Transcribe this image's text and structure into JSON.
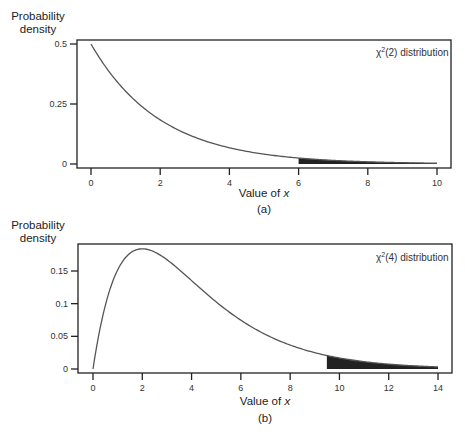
{
  "chart_data": [
    {
      "id": "a",
      "type": "line",
      "title": "χ²(2) distribution",
      "legend_text": "distribution",
      "legend_symbol": "χ",
      "legend_sup": "2",
      "legend_df": "(2)",
      "df": 2,
      "xlabel": "Value of x",
      "xlabel_prefix": "Value of ",
      "xlabel_var": "x",
      "ylabel_line1": "Probability",
      "ylabel_line2": "density",
      "caption": "(a)",
      "xlim": [
        0,
        10
      ],
      "ylim": [
        0,
        0.5
      ],
      "x_ticks": [
        0,
        2,
        4,
        6,
        8,
        10
      ],
      "x_tick_labels": [
        "0",
        "2",
        "4",
        "6",
        "8",
        "10"
      ],
      "y_ticks": [
        0,
        0.25,
        0.5
      ],
      "y_tick_labels": [
        "0",
        "0.25",
        "0.5"
      ],
      "shaded_region": {
        "from": 6,
        "to": 10
      },
      "x": [
        0,
        1,
        2,
        3,
        4,
        5,
        6,
        7,
        8,
        9,
        10
      ],
      "values": [
        0.5,
        0.303,
        0.184,
        0.112,
        0.068,
        0.041,
        0.025,
        0.015,
        0.009,
        0.006,
        0.003
      ],
      "grid": false
    },
    {
      "id": "b",
      "type": "line",
      "title": "χ²(4) distribution",
      "legend_text": "distribution",
      "legend_symbol": "χ",
      "legend_sup": "2",
      "legend_df": "(4)",
      "df": 4,
      "xlabel": "Value of x",
      "xlabel_prefix": "Value of ",
      "xlabel_var": "x",
      "ylabel_line1": "Probability",
      "ylabel_line2": "density",
      "caption": "(b)",
      "xlim": [
        0,
        14
      ],
      "ylim": [
        0,
        0.18
      ],
      "x_ticks": [
        0,
        2,
        4,
        6,
        8,
        10,
        12,
        14
      ],
      "x_tick_labels": [
        "0",
        "2",
        "4",
        "6",
        "8",
        "10",
        "12",
        "14"
      ],
      "y_ticks": [
        0,
        0.05,
        0.1,
        0.15
      ],
      "y_tick_labels": [
        "0",
        "0.05",
        "0.1",
        "0.15"
      ],
      "shaded_region": {
        "from": 9.49,
        "to": 14
      },
      "x": [
        0,
        1,
        2,
        3,
        4,
        5,
        6,
        7,
        8,
        9,
        10,
        11,
        12,
        13,
        14
      ],
      "values": [
        0,
        0.152,
        0.184,
        0.167,
        0.135,
        0.103,
        0.075,
        0.053,
        0.037,
        0.025,
        0.017,
        0.011,
        0.007,
        0.005,
        0.003
      ],
      "grid": false
    }
  ],
  "colors": {
    "curve": "#555555",
    "shade": "#222222",
    "axis": "#222222"
  }
}
